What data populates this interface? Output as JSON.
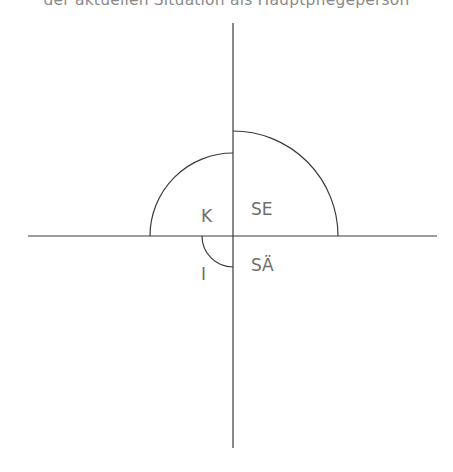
{
  "caption": {
    "text": "der aktuellen Situation als Hauptpflegeperson"
  },
  "diagram": {
    "axes": {
      "horizontal": {
        "x1": 28,
        "x2": 437,
        "y": 236
      },
      "vertical": {
        "x": 233,
        "y1": 23,
        "y2": 448
      }
    },
    "arcs": [
      {
        "id": "SE",
        "quadrant": "upper-right",
        "radius": 105
      },
      {
        "id": "K",
        "quadrant": "upper-left",
        "radius": 83
      },
      {
        "id": "I",
        "quadrant": "lower-left",
        "radius": 31
      }
    ],
    "labels": {
      "K": "K",
      "SE": "SE",
      "SA": "SÄ",
      "I": "I"
    },
    "colors": {
      "line": "#3a3a3a",
      "label": "#6e6e6e",
      "caption": "#8a8a8a"
    }
  }
}
